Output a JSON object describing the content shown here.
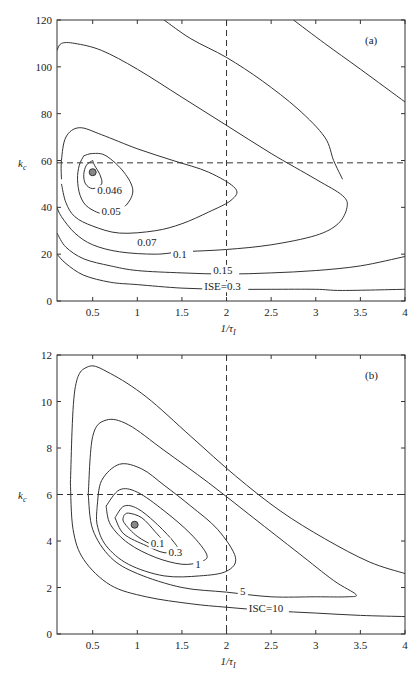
{
  "chart_data": [
    {
      "panel": "(a)",
      "type": "contour",
      "xlabel": "1/τ_I",
      "ylabel": "k_c",
      "xlim": [
        0.1,
        4
      ],
      "ylim": [
        0,
        120
      ],
      "xticks": [
        "0.5",
        "1",
        "1.5",
        "2",
        "2.5",
        "3",
        "3.5",
        "4"
      ],
      "yticks": [
        "0",
        "20",
        "40",
        "60",
        "80",
        "100",
        "120"
      ],
      "reference_lines": {
        "x": 2,
        "y": 59
      },
      "optimum_marker": {
        "x": 0.5,
        "y": 55
      },
      "contours": [
        {
          "label": "0.046",
          "points": [
            [
              0.5,
              60
            ],
            [
              0.43,
              58
            ],
            [
              0.4,
              54
            ],
            [
              0.42,
              50
            ],
            [
              0.5,
              48
            ],
            [
              0.6,
              50
            ],
            [
              0.58,
              54
            ],
            [
              0.52,
              58
            ],
            [
              0.5,
              60
            ]
          ],
          "label_pos": [
            0.55,
            46
          ]
        },
        {
          "label": "0.05",
          "points": [
            [
              0.4,
              62
            ],
            [
              0.35,
              58
            ],
            [
              0.33,
              52
            ],
            [
              0.36,
              45
            ],
            [
              0.45,
              40
            ],
            [
              0.65,
              37
            ],
            [
              0.85,
              40
            ],
            [
              0.95,
              47
            ],
            [
              0.85,
              55
            ],
            [
              0.65,
              62
            ],
            [
              0.5,
              63
            ],
            [
              0.4,
              62
            ]
          ],
          "label_pos": [
            0.6,
            37
          ]
        },
        {
          "label": "0.07",
          "points": [
            [
              0.15,
              52
            ],
            [
              0.15,
              60
            ],
            [
              0.2,
              70
            ],
            [
              0.35,
              74
            ],
            [
              0.6,
              71
            ],
            [
              1.0,
              65
            ],
            [
              1.4,
              60
            ],
            [
              1.8,
              55
            ],
            [
              2.1,
              48
            ],
            [
              2.05,
              43
            ],
            [
              1.8,
              38
            ],
            [
              1.5,
              33
            ],
            [
              1.2,
              30
            ],
            [
              0.8,
              29
            ],
            [
              0.5,
              32
            ],
            [
              0.3,
              36
            ],
            [
              0.2,
              42
            ],
            [
              0.15,
              50
            ]
          ],
          "label_pos": [
            1.0,
            24
          ]
        },
        {
          "label": "0.1",
          "points": [
            [
              0.1,
              107
            ],
            [
              0.15,
              110
            ],
            [
              0.3,
              110
            ],
            [
              0.6,
              107
            ],
            [
              1.0,
              99
            ],
            [
              1.5,
              87
            ],
            [
              2.0,
              75
            ],
            [
              2.5,
              63
            ],
            [
              3.0,
              52
            ],
            [
              3.3,
              45
            ],
            [
              3.35,
              40
            ],
            [
              3.25,
              33
            ],
            [
              3.0,
              28
            ],
            [
              2.5,
              24
            ],
            [
              2.0,
              22
            ],
            [
              1.5,
              21
            ],
            [
              1.2,
              20
            ],
            [
              0.8,
              21
            ],
            [
              0.5,
              24
            ],
            [
              0.3,
              29
            ],
            [
              0.15,
              36
            ],
            [
              0.1,
              40
            ]
          ],
          "label_pos": [
            1.4,
            19
          ]
        },
        {
          "label": "0.15",
          "points": [
            [
              0.1,
              29
            ],
            [
              0.2,
              23
            ],
            [
              0.4,
              18
            ],
            [
              0.7,
              15
            ],
            [
              1.0,
              13
            ],
            [
              1.5,
              12
            ],
            [
              2.0,
              11.5
            ],
            [
              2.5,
              12
            ],
            [
              3.0,
              13
            ],
            [
              3.5,
              15
            ],
            [
              4.0,
              19
            ]
          ],
          "label_pos": [
            1.85,
            12
          ]
        },
        {
          "label": "ISE=0.3",
          "points": [
            [
              0.1,
              20
            ],
            [
              0.2,
              16
            ],
            [
              0.4,
              11
            ],
            [
              0.7,
              8
            ],
            [
              1.0,
              7
            ],
            [
              1.5,
              5.5
            ],
            [
              2.0,
              5
            ],
            [
              2.5,
              5
            ],
            [
              3.0,
              5
            ],
            [
              3.3,
              4.5
            ],
            [
              4.0,
              5
            ]
          ],
          "label_pos": [
            1.75,
            5
          ]
        },
        {
          "label": "",
          "points": [
            [
              1.3,
              120
            ],
            [
              1.6,
              112
            ],
            [
              2.0,
              104
            ],
            [
              2.4,
              94
            ],
            [
              2.8,
              82
            ],
            [
              3.1,
              70
            ],
            [
              3.2,
              60
            ],
            [
              3.3,
              52
            ]
          ],
          "label_pos": null
        },
        {
          "label": "",
          "points": [
            [
              2.75,
              120
            ],
            [
              3.1,
              110
            ],
            [
              3.5,
              99
            ],
            [
              4.0,
              85
            ]
          ],
          "label_pos": null
        }
      ]
    },
    {
      "panel": "(b)",
      "type": "contour",
      "xlabel": "1/τ_I",
      "ylabel": "k_c",
      "xlim": [
        0.1,
        4
      ],
      "ylim": [
        0,
        12
      ],
      "xticks": [
        "0.5",
        "1",
        "1.5",
        "2",
        "2.5",
        "3",
        "3.5",
        "4"
      ],
      "yticks": [
        "0",
        "2",
        "4",
        "6",
        "8",
        "10",
        "12"
      ],
      "reference_lines": {
        "x": 2,
        "y": 6
      },
      "optimum_marker": {
        "x": 0.97,
        "y": 4.7
      },
      "contours": [
        {
          "label": "0.1",
          "points": [
            [
              0.85,
              5.1
            ],
            [
              0.9,
              5.2
            ],
            [
              1.05,
              5.0
            ],
            [
              1.2,
              4.4
            ],
            [
              1.3,
              3.9
            ],
            [
              1.2,
              3.8
            ],
            [
              1.0,
              4.2
            ],
            [
              0.85,
              4.8
            ],
            [
              0.85,
              5.1
            ]
          ],
          "label_pos": [
            1.15,
            3.8
          ]
        },
        {
          "label": "0.3",
          "points": [
            [
              0.75,
              5.0
            ],
            [
              0.85,
              5.5
            ],
            [
              1.0,
              5.4
            ],
            [
              1.2,
              4.8
            ],
            [
              1.4,
              4.0
            ],
            [
              1.45,
              3.6
            ],
            [
              1.3,
              3.5
            ],
            [
              1.1,
              3.8
            ],
            [
              0.85,
              4.3
            ],
            [
              0.75,
              5.0
            ]
          ],
          "label_pos": [
            1.35,
            3.4
          ]
        },
        {
          "label": "1",
          "points": [
            [
              0.65,
              5.5
            ],
            [
              0.8,
              6.2
            ],
            [
              1.0,
              6.1
            ],
            [
              1.3,
              5.3
            ],
            [
              1.6,
              4.3
            ],
            [
              1.78,
              3.4
            ],
            [
              1.7,
              3.1
            ],
            [
              1.5,
              3.0
            ],
            [
              1.2,
              3.3
            ],
            [
              0.9,
              3.9
            ],
            [
              0.7,
              4.7
            ],
            [
              0.65,
              5.5
            ]
          ],
          "label_pos": [
            1.65,
            2.9
          ]
        },
        {
          "label": "",
          "points": [
            [
              0.55,
              5.5
            ],
            [
              0.6,
              6.6
            ],
            [
              0.8,
              7.3
            ],
            [
              1.05,
              7.1
            ],
            [
              1.3,
              6.4
            ],
            [
              1.6,
              5.5
            ],
            [
              1.9,
              4.5
            ],
            [
              2.1,
              3.3
            ],
            [
              2.0,
              2.7
            ],
            [
              1.7,
              2.5
            ],
            [
              1.3,
              2.5
            ],
            [
              0.9,
              3.0
            ],
            [
              0.65,
              3.8
            ],
            [
              0.55,
              4.7
            ],
            [
              0.55,
              5.5
            ]
          ],
          "label_pos": null
        },
        {
          "label": "5",
          "points": [
            [
              0.45,
              6.0
            ],
            [
              0.5,
              8.5
            ],
            [
              0.65,
              9.2
            ],
            [
              0.9,
              9.0
            ],
            [
              1.3,
              7.9
            ],
            [
              1.8,
              6.5
            ],
            [
              2.3,
              5.0
            ],
            [
              2.8,
              3.5
            ],
            [
              3.2,
              2.3
            ],
            [
              3.45,
              1.7
            ],
            [
              3.35,
              1.6
            ],
            [
              3.0,
              1.6
            ],
            [
              2.5,
              1.6
            ],
            [
              2.0,
              1.8
            ],
            [
              1.5,
              2.0
            ],
            [
              1.0,
              2.6
            ],
            [
              0.7,
              3.3
            ],
            [
              0.5,
              4.5
            ],
            [
              0.45,
              6.0
            ]
          ],
          "label_pos": [
            2.15,
            1.7
          ]
        },
        {
          "label": "ISC=10",
          "points": [
            [
              0.25,
              6.5
            ],
            [
              0.3,
              10.5
            ],
            [
              0.45,
              11.5
            ],
            [
              0.7,
              11.2
            ],
            [
              1.1,
              10.2
            ],
            [
              1.6,
              8.5
            ],
            [
              2.1,
              6.8
            ],
            [
              2.6,
              5.3
            ],
            [
              3.1,
              4.1
            ],
            [
              3.6,
              3.1
            ],
            [
              4.0,
              2.6
            ]
          ],
          "label_pos": null
        },
        {
          "label": "",
          "points": [
            [
              0.25,
              6.5
            ],
            [
              0.28,
              4.5
            ],
            [
              0.4,
              3.2
            ],
            [
              0.7,
              2.1
            ],
            [
              1.1,
              1.6
            ],
            [
              1.6,
              1.3
            ],
            [
              2.0,
              1.15
            ],
            [
              2.5,
              1.0
            ],
            [
              3.0,
              0.9
            ],
            [
              3.5,
              0.8
            ],
            [
              4.0,
              0.75
            ]
          ],
          "label_pos": [
            2.5,
            1.0
          ]
        }
      ],
      "labels_extra": {
        "isc": "ISC=10"
      }
    }
  ],
  "panels": {
    "a": {
      "tag": "(a)",
      "xlabel": "1/τ",
      "xlabel_sub": "I",
      "ylabel": "k",
      "ylabel_sub": "c"
    },
    "b": {
      "tag": "(b)",
      "xlabel": "1/τ",
      "xlabel_sub": "I",
      "ylabel": "k",
      "ylabel_sub": "c"
    }
  }
}
